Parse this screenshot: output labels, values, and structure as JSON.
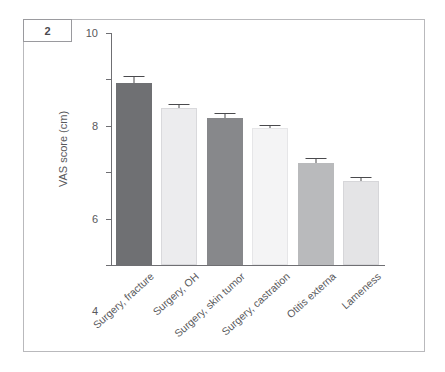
{
  "panel": {
    "number": "2"
  },
  "chart_data": {
    "type": "bar",
    "title": "",
    "xlabel": "",
    "ylabel": "VAS score (cm)",
    "ylim": [
      0,
      10
    ],
    "yticks": [
      "0",
      "2",
      "4",
      "6",
      "8",
      "10"
    ],
    "grid": false,
    "legend": "none",
    "categories": [
      "Surgery, fracture",
      "Surgery, OH",
      "Surgery, skin tumor",
      "Surgery, castration",
      "Otitis externa",
      "Lameness"
    ],
    "values": [
      7.85,
      6.75,
      6.35,
      5.9,
      4.4,
      3.62
    ],
    "errors": [
      0.28,
      0.17,
      0.19,
      0.12,
      0.2,
      0.17
    ],
    "bar_colors": [
      "#6f7073",
      "#ececee",
      "#87888b",
      "#f4f4f5",
      "#b9babc",
      "#e4e4e6"
    ],
    "bar_border_colors": [
      "#6f7073",
      "#d9d9dc",
      "#87888b",
      "#e6e6e8",
      "#b9babc",
      "#d6d6d9"
    ]
  },
  "style": {
    "axis_color": "#6f6f73",
    "text_color": "#58585b",
    "frame_color": "#b9b9bc",
    "error_color": "#4a4a4d"
  }
}
